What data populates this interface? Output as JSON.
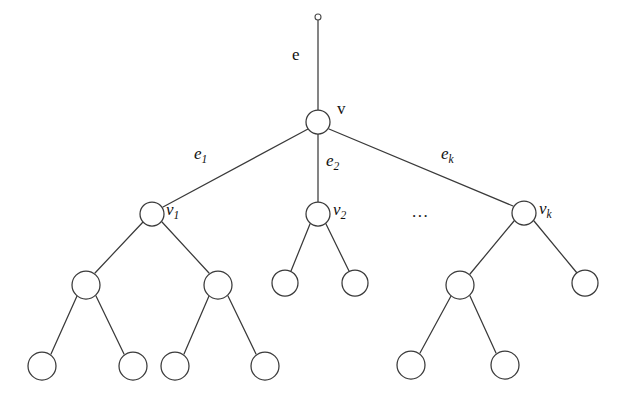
{
  "figure": {
    "background": "#ffffff",
    "stroke_color": "#3a3a3a",
    "text_color": "#111111",
    "width": 623,
    "height": 407
  },
  "labels": {
    "root_edge": "e",
    "root_vertex": "v",
    "edge_1": "e",
    "edge_1_sub": "1",
    "edge_2": "e",
    "edge_2_sub": "2",
    "edge_k": "e",
    "edge_k_sub": "k",
    "vertex_1": "v",
    "vertex_1_sub": "1",
    "vertex_2": "v",
    "vertex_2_sub": "2",
    "vertex_k": "v",
    "vertex_k_sub": "k",
    "ellipsis": "..."
  },
  "graph": {
    "node_radius": 12,
    "tip_radius": 3,
    "nodes": [
      {
        "id": "tip",
        "x": 318,
        "y": 17,
        "r": 3,
        "kind": "tip"
      },
      {
        "id": "v",
        "x": 318,
        "y": 122,
        "r": 12,
        "kind": "vertex"
      },
      {
        "id": "v1",
        "x": 152,
        "y": 214,
        "r": 12,
        "kind": "vertex"
      },
      {
        "id": "v2",
        "x": 318,
        "y": 214,
        "r": 12,
        "kind": "vertex"
      },
      {
        "id": "vk",
        "x": 524,
        "y": 213,
        "r": 12,
        "kind": "vertex"
      },
      {
        "id": "a1",
        "x": 86,
        "y": 285,
        "r": 14,
        "kind": "vertex"
      },
      {
        "id": "a2",
        "x": 218,
        "y": 285,
        "r": 14,
        "kind": "vertex"
      },
      {
        "id": "b1",
        "x": 285,
        "y": 283,
        "r": 13,
        "kind": "vertex"
      },
      {
        "id": "b2",
        "x": 355,
        "y": 283,
        "r": 13,
        "kind": "vertex"
      },
      {
        "id": "c1",
        "x": 460,
        "y": 285,
        "r": 14,
        "kind": "vertex"
      },
      {
        "id": "c2",
        "x": 585,
        "y": 283,
        "r": 13,
        "kind": "vertex"
      },
      {
        "id": "l1",
        "x": 42,
        "y": 366,
        "r": 14,
        "kind": "leaf"
      },
      {
        "id": "l2",
        "x": 133,
        "y": 366,
        "r": 14,
        "kind": "leaf"
      },
      {
        "id": "l3",
        "x": 175,
        "y": 366,
        "r": 14,
        "kind": "leaf"
      },
      {
        "id": "l4",
        "x": 265,
        "y": 366,
        "r": 14,
        "kind": "leaf"
      },
      {
        "id": "l5",
        "x": 411,
        "y": 365,
        "r": 14,
        "kind": "leaf"
      },
      {
        "id": "l6",
        "x": 505,
        "y": 365,
        "r": 14,
        "kind": "leaf"
      }
    ],
    "edges": [
      {
        "from": "tip",
        "to": "v",
        "label": "e"
      },
      {
        "from": "v",
        "to": "v1",
        "label": "e1"
      },
      {
        "from": "v",
        "to": "v2",
        "label": "e2"
      },
      {
        "from": "v",
        "to": "vk",
        "label": "ek"
      },
      {
        "from": "v1",
        "to": "a1",
        "label": ""
      },
      {
        "from": "v1",
        "to": "a2",
        "label": ""
      },
      {
        "from": "a1",
        "to": "l1",
        "label": ""
      },
      {
        "from": "a1",
        "to": "l2",
        "label": ""
      },
      {
        "from": "a2",
        "to": "l3",
        "label": ""
      },
      {
        "from": "a2",
        "to": "l4",
        "label": ""
      },
      {
        "from": "v2",
        "to": "b1",
        "label": ""
      },
      {
        "from": "v2",
        "to": "b2",
        "label": ""
      },
      {
        "from": "vk",
        "to": "c1",
        "label": ""
      },
      {
        "from": "vk",
        "to": "c2",
        "label": ""
      },
      {
        "from": "c1",
        "to": "l5",
        "label": ""
      },
      {
        "from": "c1",
        "to": "l6",
        "label": ""
      }
    ],
    "label_positions": [
      {
        "id": "e",
        "x": 293,
        "y": 50
      },
      {
        "id": "v",
        "x": 336,
        "y": 102
      },
      {
        "id": "e1",
        "x": 194,
        "y": 148
      },
      {
        "id": "e2",
        "x": 326,
        "y": 155
      },
      {
        "id": "ek",
        "x": 441,
        "y": 148
      },
      {
        "id": "v1",
        "x": 166,
        "y": 203
      },
      {
        "id": "v2",
        "x": 333,
        "y": 203
      },
      {
        "id": "vk",
        "x": 539,
        "y": 202
      },
      {
        "id": "dots",
        "x": 412,
        "y": 205
      }
    ]
  }
}
